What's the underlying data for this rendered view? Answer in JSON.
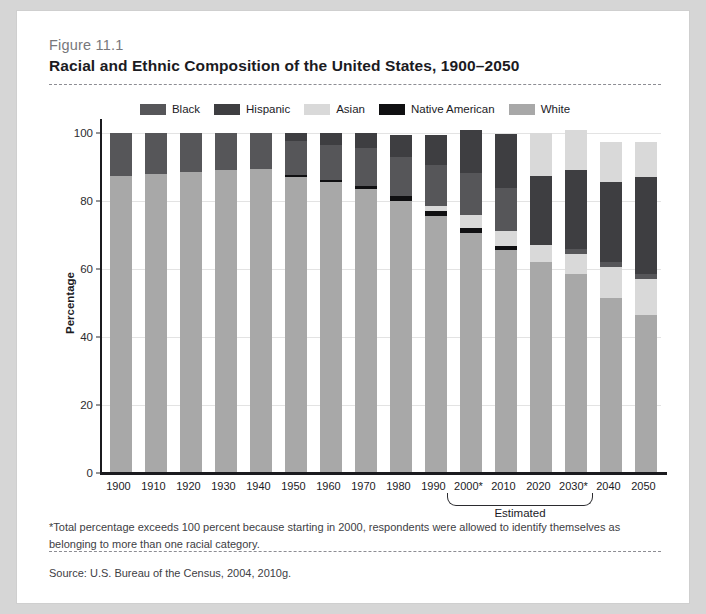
{
  "figure": {
    "number": "Figure 11.1",
    "title": "Racial and Ethnic Composition of the United States, 1900–2050",
    "footnote": "*Total percentage exceeds 100 percent because starting in 2000, respondents were allowed to identify themselves as belonging to more than one racial category.",
    "source": "Source: U.S. Bureau of the Census, 2004, 2010g.",
    "estimated_label": "Estimated"
  },
  "colors": {
    "black": "#565659",
    "hispanic": "#3e3e41",
    "asian": "#d9d9d9",
    "native_american": "#101012",
    "white": "#a8a8a8",
    "axis": "#1b1b1f",
    "grid": "#e3e3e3",
    "panel_bg": "#ffffff",
    "page_bg": "#d6d6d6"
  },
  "chart_data": {
    "type": "bar",
    "stacked": true,
    "title": "Racial and Ethnic Composition of the United States, 1900–2050",
    "xlabel": "",
    "ylabel": "Percentage",
    "ylim": [
      0,
      100
    ],
    "yticks": [
      0,
      20,
      40,
      60,
      80,
      100
    ],
    "grid": true,
    "legend_position": "top-center",
    "categories": [
      "1900",
      "1910",
      "1920",
      "1930",
      "1940",
      "1950",
      "1960",
      "1970",
      "1980",
      "1990",
      "2000*",
      "2010",
      "2020",
      "2030*",
      "2040",
      "2050"
    ],
    "estimated_categories": [
      "2020",
      "2030*",
      "2040",
      "2050"
    ],
    "series": [
      {
        "name": "White",
        "color": "#a8a8a8",
        "values": [
          87.5,
          88.0,
          88.5,
          89.0,
          89.5,
          87.0,
          85.5,
          83.5,
          80.0,
          75.5,
          70.5,
          65.5,
          62.0,
          58.5,
          51.5,
          46.5
        ]
      },
      {
        "name": "Native American",
        "color": "#101012",
        "values": [
          0.0,
          0.0,
          0.0,
          0.0,
          0.0,
          0.6,
          0.6,
          1.0,
          1.5,
          1.5,
          1.5,
          1.3,
          0.0,
          0.0,
          0.0,
          0.0
        ]
      },
      {
        "name": "Asian",
        "color": "#d9d9d9",
        "values": [
          0.0,
          0.0,
          0.0,
          0.0,
          0.0,
          0.0,
          0.0,
          0.0,
          0.0,
          1.5,
          3.8,
          4.5,
          5.0,
          6.0,
          9.0,
          10.5
        ]
      },
      {
        "name": "Black",
        "color": "#565659",
        "values": [
          12.5,
          12.0,
          11.5,
          11.0,
          10.5,
          10.0,
          10.5,
          11.0,
          11.5,
          12.0,
          12.5,
          12.5,
          0.0,
          1.5,
          1.5,
          1.5
        ]
      },
      {
        "name": "Hispanic",
        "color": "#3e3e41",
        "values": [
          0.0,
          0.0,
          0.0,
          0.0,
          0.0,
          2.4,
          3.4,
          4.5,
          6.5,
          9.0,
          12.5,
          16.0,
          20.5,
          23.0,
          23.5,
          28.5
        ]
      },
      {
        "name": "Asian (top)",
        "color": "#d9d9d9",
        "values": [
          0.0,
          0.0,
          0.0,
          0.0,
          0.0,
          0.0,
          0.0,
          0.0,
          0.0,
          0.0,
          0.0,
          0.0,
          12.5,
          12.0,
          12.0,
          10.5
        ]
      }
    ],
    "totals": [
      100,
      100,
      100,
      100,
      100,
      100,
      100,
      100,
      99.5,
      99.5,
      101.3,
      99.8,
      100.0,
      101.0,
      97.5,
      97.5
    ]
  },
  "legend": {
    "items": [
      {
        "label": "Black",
        "color": "#565659"
      },
      {
        "label": "Hispanic",
        "color": "#3e3e41"
      },
      {
        "label": "Asian",
        "color": "#d9d9d9"
      },
      {
        "label": "Native American",
        "color": "#101012"
      },
      {
        "label": "White",
        "color": "#a8a8a8"
      }
    ]
  }
}
